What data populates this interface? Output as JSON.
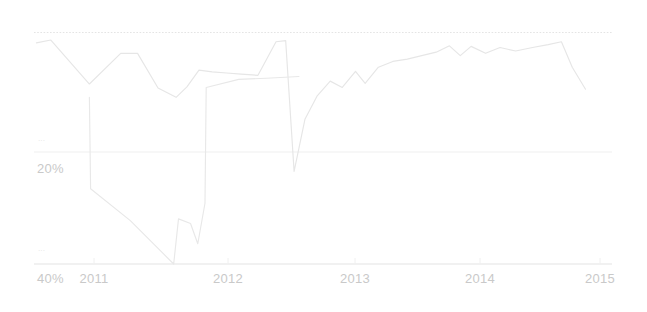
{
  "chart_data": {
    "type": "line",
    "title": "",
    "subtitle": "",
    "xlabel": "",
    "ylabel": "",
    "grid": true,
    "legend_position": "none",
    "axis_inverted_y": true,
    "xlim": [
      2010.7,
      2015.5
    ],
    "ylim": [
      0,
      46
    ],
    "x_tick_labels": [
      "2011",
      "2012",
      "2013",
      "2014",
      "2015"
    ],
    "x_tick_values": [
      2011,
      2012,
      2013,
      2014,
      2015
    ],
    "y_tick_labels": [
      "20%",
      "40%"
    ],
    "y_tick_values": [
      20,
      40
    ],
    "gridlines_y": [
      0,
      20,
      40
    ],
    "series": [
      {
        "name": "upper-trace",
        "color": "#e6e6e6",
        "x": [
          2010.72,
          2010.84,
          2011.16,
          2011.42,
          2011.56,
          2011.73,
          2011.88,
          2011.97,
          2012.07,
          2012.18,
          2012.3,
          2012.42,
          2012.56,
          2012.71,
          2012.79,
          2012.86,
          2012.95,
          2013.05,
          2013.16,
          2013.26,
          2013.37,
          2013.45,
          2013.56,
          2013.68,
          2013.8,
          2013.92,
          2014.04,
          2014.15,
          2014.24,
          2014.33,
          2014.45,
          2014.57,
          2014.7,
          2014.84,
          2014.97,
          2015.08,
          2015.17,
          2015.28
        ],
        "values": [
          1.8,
          1.3,
          8.9,
          3.6,
          3.6,
          9.6,
          11.2,
          9.4,
          6.5,
          6.8,
          7.0,
          7.2,
          7.4,
          1.6,
          1.4,
          24.0,
          15.0,
          11.0,
          8.4,
          9.5,
          6.7,
          8.8,
          6.0,
          5.0,
          4.6,
          4.0,
          3.4,
          2.3,
          4.0,
          2.4,
          3.6,
          2.6,
          3.2,
          2.6,
          2.1,
          1.6,
          6.0,
          9.8
        ]
      },
      {
        "name": "lower-trace",
        "color": "#e8e8e8",
        "x": [
          2011.16,
          2011.17,
          2011.5,
          2011.86,
          2011.9,
          2012.0,
          2012.06,
          2012.12,
          2012.13,
          2012.4,
          2012.63,
          2012.9
        ],
        "values": [
          11.2,
          27.0,
          32.5,
          40.0,
          32.2,
          33.0,
          36.5,
          29.5,
          9.5,
          8.1,
          7.9,
          7.6
        ]
      }
    ],
    "annotations": []
  },
  "axis": {
    "y_labels": [
      {
        "text": "20%",
        "stub": "···"
      },
      {
        "text": "40%",
        "stub": "···"
      }
    ],
    "x_labels": [
      "2011",
      "2012",
      "2013",
      "2014",
      "2015"
    ]
  },
  "colors": {
    "background": "#ffffff",
    "line_primary": "#e6e6e6",
    "line_secondary": "#e8e8e8",
    "grid_dotted": "#e4e4e4",
    "grid_solid": "#ededed",
    "axis_line": "#e0e0e0",
    "label_text": "#c9c9c9",
    "stub_text": "#e2e2e2"
  }
}
